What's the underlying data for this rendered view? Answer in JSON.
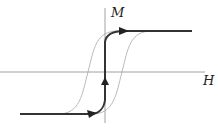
{
  "diagram": {
    "type": "magnetic-hysteresis",
    "axes": {
      "x_label": "H",
      "y_label": "M"
    },
    "curves": [
      {
        "name": "hysteresis-loop",
        "style": "thin",
        "color": "#999999"
      },
      {
        "name": "initial-magnetization-path",
        "style": "bold",
        "color": "#333333",
        "arrows": 3
      }
    ],
    "colors": {
      "axis": "#888888",
      "loop": "#a0a0a0",
      "path": "#333333"
    }
  }
}
